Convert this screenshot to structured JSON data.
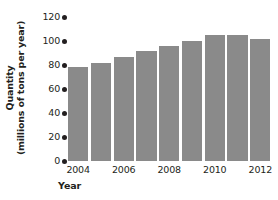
{
  "chart_data": {
    "type": "bar",
    "title": "",
    "xlabel": "Year",
    "ylabel": "Quantity (millions of tons per year)",
    "ylabel_lines": [
      "Quantity",
      "(millions of tons per year)"
    ],
    "categories": [
      "2004",
      "2005",
      "2006",
      "2007",
      "2008",
      "2009",
      "2010",
      "2011",
      "2012"
    ],
    "values": [
      78,
      82,
      87,
      92,
      96,
      100,
      105,
      105,
      102
    ],
    "ylim": [
      0,
      120
    ],
    "yticks": [
      0,
      20,
      40,
      60,
      80,
      100,
      120
    ],
    "ytick_labels": [
      "0",
      "20",
      "40",
      "60",
      "80",
      "100",
      "120"
    ],
    "xtick_labels": [
      "2004",
      "2006",
      "2008",
      "2010",
      "2012"
    ],
    "xtick_categories": [
      "2004",
      "2006",
      "2008",
      "2010",
      "2012"
    ],
    "grid": false,
    "legend": false,
    "bar_color": "#8a8a8a",
    "axis_color": "#231f20",
    "background": "#ffffff",
    "tick_marker_style": "dot"
  }
}
